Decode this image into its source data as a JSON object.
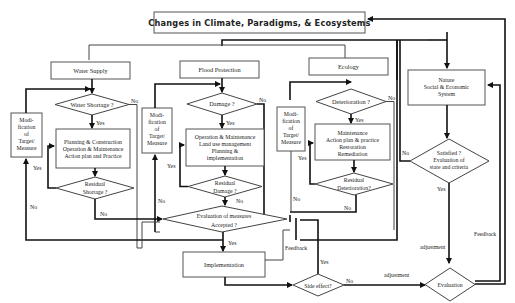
{
  "title": "Changes in Climate, Paradigms, & Ecosystems",
  "sectors": {
    "water": {
      "header": "Water Supply",
      "question": "Water Shortage ?",
      "actions": [
        "Planning & Construction",
        "Operation & Maintenance",
        "Action plan and Practice"
      ],
      "residual": [
        "Residual",
        "Shortage ?"
      ],
      "modification": [
        "Modi-",
        "fication",
        "of",
        "Target/",
        "Measure"
      ]
    },
    "flood": {
      "header": "Flood Protection",
      "question": "Damage ?",
      "actions": [
        "Operation & Maintenance",
        "Land use management",
        "Planning &",
        "implementation"
      ],
      "residual": [
        "Residual",
        "Damage ?"
      ],
      "modification": [
        "Modi-",
        "fication",
        "of",
        "Target/",
        "Measure"
      ]
    },
    "ecology": {
      "header": "Ecology",
      "question": "Deterioration ?",
      "actions": [
        "Maintenance",
        "Action plan & practice",
        "Restoration",
        "Remediation"
      ],
      "residual": [
        "Residual",
        "Deterioration?"
      ],
      "modification": [
        "Modi-",
        "fication",
        "of",
        "Target/",
        "Measure"
      ]
    }
  },
  "evaluation_measures": [
    "Evaluation of measures",
    "Accepted ?"
  ],
  "implementation": "Implementation",
  "side_effect": "Side effect?",
  "evaluation": "Evaluation",
  "system": [
    "Nature",
    "Social & Economic",
    "System"
  ],
  "satisfied": [
    "Satisfied ?",
    "Evaluation of",
    "state and criteria"
  ],
  "labels": {
    "yes": "Yes",
    "no": "No",
    "feedback": "Feedback",
    "adjustment": "adjustment"
  }
}
